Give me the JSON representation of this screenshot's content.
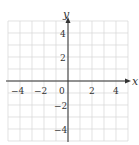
{
  "chart_data": {
    "type": "scatter",
    "title": "",
    "xlabel": "x",
    "ylabel": "y",
    "xlim": [
      -5,
      5
    ],
    "ylim": [
      -5,
      5
    ],
    "grid": true,
    "grid_step": 1,
    "x_ticks": [
      -4,
      -2,
      0,
      2,
      4
    ],
    "y_ticks": [
      4,
      2,
      -2,
      -4
    ],
    "x_tick_labels": [
      "−4",
      "−2",
      "0",
      "2",
      "4"
    ],
    "y_tick_labels": [
      "4",
      "2",
      "−2",
      "−4"
    ],
    "series": [],
    "colors": {
      "grid": "#d6d6d6",
      "axis": "#333333"
    }
  }
}
